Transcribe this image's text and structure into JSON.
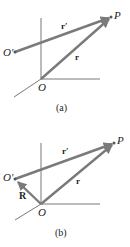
{
  "figures": [
    {
      "caption": "(a)",
      "labels": {
        "P": "P",
        "O_prime": "O′",
        "O": "O",
        "r_prime": "r′",
        "r": "r"
      }
    },
    {
      "caption": "(b)",
      "labels": {
        "P": "P",
        "O_prime": "O′",
        "O": "O",
        "r_prime": "r′",
        "r": "r",
        "R": "R"
      }
    }
  ],
  "colors": {
    "vector": "#7a7a7a",
    "axis": "#555555",
    "text": "#222222"
  }
}
